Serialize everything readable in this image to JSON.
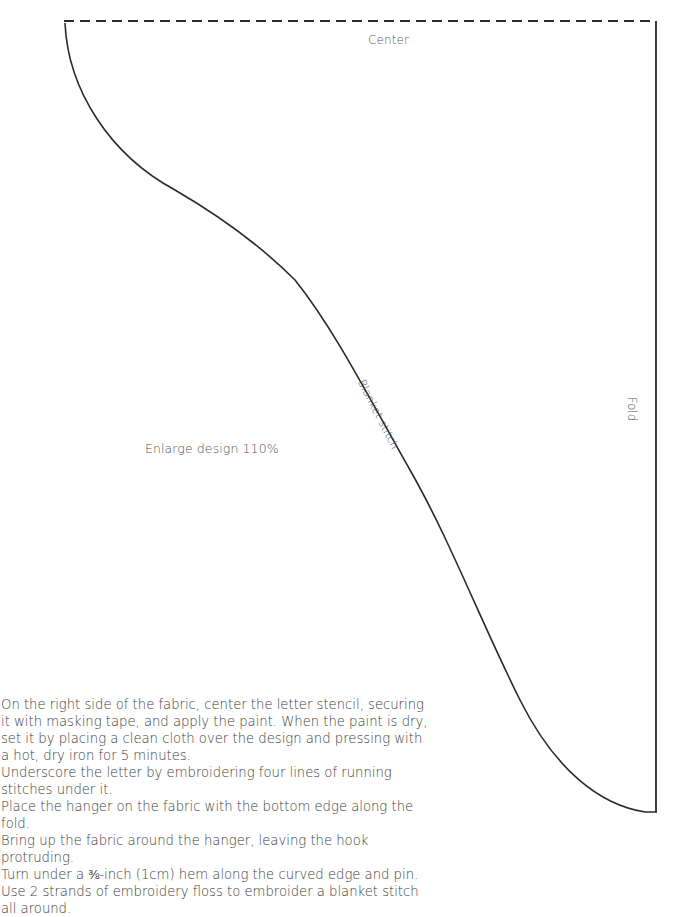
{
  "pattern": {
    "labels": {
      "center": "Center",
      "fold": "Fold",
      "blanket_stitch": "Blanket stitch",
      "enlarge": "Enlarge design 110%"
    },
    "colors": {
      "outline": "#2a2a2a",
      "text": "#3c3c3c"
    }
  },
  "instructions": {
    "paragraphs": [
      "On the right side of the fabric, center the letter stencil, securing it with masking tape, and apply the paint. When the paint is dry, set it by placing a clean cloth over the design and pressing with a hot, dry iron for 5 minutes.",
      "Underscore the letter by embroidering four lines of running stitches under it.",
      "Place the hanger on the fabric with the bottom edge along the fold.",
      "Bring up the fabric around the hanger, leaving the hook protruding.",
      "Turn under a ⅜-inch (1cm) hem along the curved edge and pin.",
      "Use 2 strands of embroidery floss to embroider a blanket stitch all around."
    ]
  }
}
